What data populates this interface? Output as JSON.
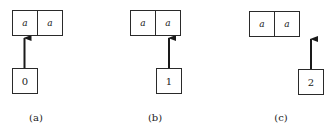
{
  "figure": {
    "panels": [
      {
        "id": "a",
        "caption": "(a)",
        "pair_cells": [
          "a",
          "a"
        ],
        "pointer_value": "0",
        "pointer_target_cell": 0
      },
      {
        "id": "b",
        "caption": "(b)",
        "pair_cells": [
          "a",
          "a"
        ],
        "pointer_value": "1",
        "pointer_target_cell": 1
      },
      {
        "id": "c",
        "caption": "(c)",
        "pair_cells": [
          "a",
          "a"
        ],
        "pointer_value": "2",
        "pointer_target_cell": "beyond-end"
      }
    ],
    "colors": {
      "stroke": "#2a2a2a",
      "background": "#ffffff"
    }
  }
}
